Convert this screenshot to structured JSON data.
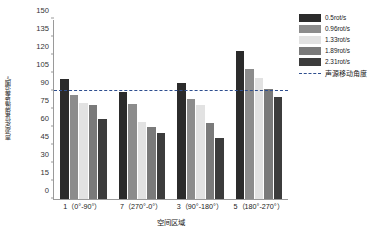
{
  "chart_data": {
    "type": "bar",
    "title": "",
    "xlabel": "空间区域",
    "ylabel": "声源定位角度误差范围/°",
    "ylim": [
      0,
      150
    ],
    "ytick_step": 15,
    "yticks": [
      0,
      15,
      30,
      45,
      60,
      75,
      90,
      105,
      120,
      135,
      150
    ],
    "grid": false,
    "legend_position": "right",
    "categories": [
      "1（0°-90°）",
      "7（270°-0°）",
      "3（90°-180°）",
      "5（180°-270°）"
    ],
    "series": [
      {
        "name": "0.5rot/s",
        "color": "#2b2b2b",
        "values": [
          100,
          89,
          97,
          123
        ]
      },
      {
        "name": "0.96rot/s",
        "color": "#8c8c8c",
        "values": [
          87,
          79,
          83,
          108
        ]
      },
      {
        "name": "1.33rot/s",
        "color": "#e2e2e2",
        "values": [
          80,
          64,
          78,
          101
        ]
      },
      {
        "name": "1.89rot/s",
        "color": "#7a7a7a",
        "values": [
          78,
          60,
          63,
          92
        ]
      },
      {
        "name": "2.31rot/s",
        "color": "#3c3c3c",
        "values": [
          67,
          55,
          51,
          85
        ]
      }
    ],
    "reference_line": {
      "label": "声源移动角度",
      "value": 90,
      "color": "#2f4f8f",
      "style": "dashed"
    }
  },
  "legend": {
    "items": [
      {
        "label": "0.5rot/s",
        "type": "swatch"
      },
      {
        "label": "0.96rot/s",
        "type": "swatch"
      },
      {
        "label": "1.33rot/s",
        "type": "swatch"
      },
      {
        "label": "1.89rot/s",
        "type": "swatch"
      },
      {
        "label": "2.31rot/s",
        "type": "swatch"
      },
      {
        "label": "声源移动角度",
        "type": "dash"
      }
    ]
  }
}
